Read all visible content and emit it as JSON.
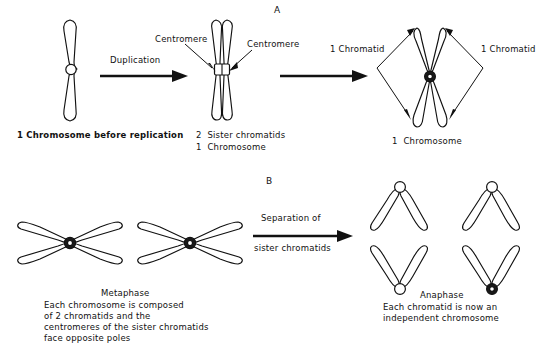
{
  "figure": {
    "panels": [
      {
        "letter": "A"
      },
      {
        "letter": "B"
      }
    ]
  },
  "panel_a": {
    "letter": "A",
    "process_label": "Duplication",
    "callout_left": "Centromere",
    "callout_right": "Centromere",
    "chromatid_label_left": "1 Chromatid",
    "chromatid_label_right": "1 Chromatid",
    "caption_left": "1 Chromosome before replication",
    "caption_mid_line1": "2  Sister chromatids",
    "caption_mid_line2": "1  Chromosome",
    "caption_right": "1  Chromosome"
  },
  "panel_b": {
    "letter": "B",
    "process_label_line1": "Separation of",
    "process_label_line2": "sister chromatids",
    "metaphase": {
      "title": "Metaphase",
      "line1": "Each chromosome is composed",
      "line2": "of 2 chromatids and the",
      "line3": "centromeres of the sister chromatids",
      "line4": "face opposite poles"
    },
    "anaphase": {
      "title": "Anaphase",
      "line1": "Each chromatid is now an",
      "line2": "independent chromosome"
    }
  },
  "colors": {
    "ink": "#111111",
    "paper": "#ffffff"
  }
}
